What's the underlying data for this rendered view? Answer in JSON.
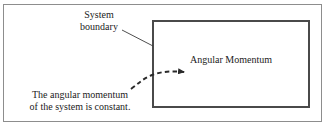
{
  "figure": {
    "width": 329,
    "height": 126,
    "background_color": "#ffffff",
    "frame_color": "#8d8d8d",
    "ink_color": "#1b1b1b",
    "box_border_color": "#4a4a4a"
  },
  "system_boundary": {
    "label_line_1": "System",
    "label_line_2": "boundary",
    "leader_line": "diagonal-pointer-to-box-corner"
  },
  "box_contents": {
    "quantity_label": "Angular Momentum"
  },
  "flow_arrow": {
    "style": "dashed-curved-arrow",
    "direction": "left-to-right-into-box",
    "arrowhead": "solid-triangle"
  },
  "caption": {
    "line_1": "The angular momentum",
    "line_2": "of the system is constant."
  }
}
